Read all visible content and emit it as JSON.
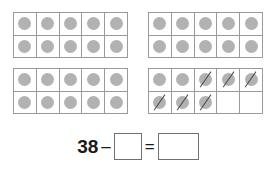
{
  "worksheet": {
    "type": "ten-frame-subtraction",
    "total_counters": 38,
    "crossed_out_counters": 6,
    "frames": [
      {
        "name": "ten-frame-1",
        "rows": [
          [
            {
              "counter": true,
              "crossed": false
            },
            {
              "counter": true,
              "crossed": false
            },
            {
              "counter": true,
              "crossed": false
            },
            {
              "counter": true,
              "crossed": false
            },
            {
              "counter": true,
              "crossed": false
            }
          ],
          [
            {
              "counter": true,
              "crossed": false
            },
            {
              "counter": true,
              "crossed": false
            },
            {
              "counter": true,
              "crossed": false
            },
            {
              "counter": true,
              "crossed": false
            },
            {
              "counter": true,
              "crossed": false
            }
          ]
        ]
      },
      {
        "name": "ten-frame-2",
        "rows": [
          [
            {
              "counter": true,
              "crossed": false
            },
            {
              "counter": true,
              "crossed": false
            },
            {
              "counter": true,
              "crossed": false
            },
            {
              "counter": true,
              "crossed": false
            },
            {
              "counter": true,
              "crossed": false
            }
          ],
          [
            {
              "counter": true,
              "crossed": false
            },
            {
              "counter": true,
              "crossed": false
            },
            {
              "counter": true,
              "crossed": false
            },
            {
              "counter": true,
              "crossed": false
            },
            {
              "counter": true,
              "crossed": false
            }
          ]
        ]
      },
      {
        "name": "ten-frame-3",
        "rows": [
          [
            {
              "counter": true,
              "crossed": false
            },
            {
              "counter": true,
              "crossed": false
            },
            {
              "counter": true,
              "crossed": false
            },
            {
              "counter": true,
              "crossed": false
            },
            {
              "counter": true,
              "crossed": false
            }
          ],
          [
            {
              "counter": true,
              "crossed": false
            },
            {
              "counter": true,
              "crossed": false
            },
            {
              "counter": true,
              "crossed": false
            },
            {
              "counter": true,
              "crossed": false
            },
            {
              "counter": true,
              "crossed": false
            }
          ]
        ]
      },
      {
        "name": "ten-frame-4",
        "rows": [
          [
            {
              "counter": true,
              "crossed": false
            },
            {
              "counter": true,
              "crossed": false
            },
            {
              "counter": true,
              "crossed": true
            },
            {
              "counter": true,
              "crossed": true
            },
            {
              "counter": true,
              "crossed": true
            }
          ],
          [
            {
              "counter": true,
              "crossed": true
            },
            {
              "counter": true,
              "crossed": true
            },
            {
              "counter": true,
              "crossed": true
            },
            {
              "counter": false,
              "crossed": false
            },
            {
              "counter": false,
              "crossed": false
            }
          ]
        ]
      }
    ]
  },
  "equation": {
    "minuend": "38",
    "minus_sign": "–",
    "subtrahend_value": "",
    "equals_sign": "=",
    "difference_value": ""
  },
  "colors": {
    "counter_fill": "#b2b2b2",
    "frame_border": "#9a9a9a",
    "strike_line": "#4a4a4a",
    "box_border": "#707070",
    "text": "#1a1a1a",
    "background": "#ffffff"
  }
}
